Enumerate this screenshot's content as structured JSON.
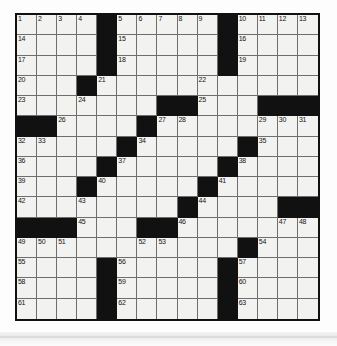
{
  "puzzle": {
    "type": "crossword-grid",
    "size": {
      "rows": 15,
      "cols": 15
    },
    "colors": {
      "page_background": "#fdfdfd",
      "cell_fill": "#f2f2f0",
      "block_fill": "#111111",
      "grid_line": "#6e6e6e",
      "outer_border": "#111111",
      "number_text": "#141414"
    },
    "legend": {
      "open_cell": "white-cell",
      "blocked_cell": "black-square"
    },
    "grid": [
      [
        "1",
        "2",
        "3",
        "4",
        "#",
        "5",
        "6",
        "7",
        "8",
        "9",
        "#",
        "10",
        "11",
        "12",
        "13"
      ],
      [
        "14",
        "",
        "",
        "",
        "#",
        "15",
        "",
        "",
        "",
        "",
        "#",
        "16",
        "",
        "",
        ""
      ],
      [
        "17",
        "",
        "",
        "",
        "#",
        "18",
        "",
        "",
        "",
        "",
        "#",
        "19",
        "",
        "",
        ""
      ],
      [
        "20",
        "",
        "",
        "#",
        "21",
        "",
        "",
        "",
        "",
        "22",
        "",
        "",
        "",
        "",
        ""
      ],
      [
        "23",
        "",
        "",
        "24",
        "",
        "",
        "",
        "#",
        "#",
        "25",
        "",
        "",
        "#",
        "#",
        "#"
      ],
      [
        "#",
        "#",
        "26",
        "",
        "",
        "",
        "#",
        "27",
        "28",
        "",
        "",
        "",
        "29",
        "30",
        "31"
      ],
      [
        "32",
        "33",
        "",
        "",
        "",
        "#",
        "34",
        "",
        "",
        "",
        "",
        "#",
        "35",
        "",
        ""
      ],
      [
        "36",
        "",
        "",
        "",
        "#",
        "37",
        "",
        "",
        "",
        "",
        "#",
        "38",
        "",
        "",
        ""
      ],
      [
        "39",
        "",
        "",
        "#",
        "40",
        "",
        "",
        "",
        "",
        "#",
        "41",
        "",
        "",
        "",
        ""
      ],
      [
        "42",
        "",
        "",
        "43",
        "",
        "",
        "",
        "",
        "#",
        "44",
        "",
        "",
        "",
        "#",
        "#"
      ],
      [
        "#",
        "#",
        "#",
        "45",
        "",
        "",
        "#",
        "#",
        "46",
        "",
        "",
        "",
        "",
        "47",
        "48"
      ],
      [
        "49",
        "50",
        "51",
        "",
        "",
        "",
        "52",
        "53",
        "",
        "",
        "",
        "#",
        "54",
        "",
        ""
      ],
      [
        "55",
        "",
        "",
        "",
        "#",
        "56",
        "",
        "",
        "",
        "",
        "#",
        "57",
        "",
        "",
        ""
      ],
      [
        "58",
        "",
        "",
        "",
        "#",
        "59",
        "",
        "",
        "",
        "",
        "#",
        "60",
        "",
        "",
        ""
      ],
      [
        "61",
        "",
        "",
        "",
        "#",
        "62",
        "",
        "",
        "",
        "",
        "#",
        "63",
        "",
        "",
        ""
      ]
    ],
    "numbers_present": [
      "1",
      "2",
      "3",
      "4",
      "5",
      "6",
      "7",
      "8",
      "9",
      "10",
      "11",
      "12",
      "13",
      "14",
      "15",
      "16",
      "17",
      "18",
      "19",
      "20",
      "21",
      "22",
      "23",
      "24",
      "25",
      "26",
      "27",
      "28",
      "29",
      "30",
      "31",
      "32",
      "33",
      "34",
      "35",
      "36",
      "37",
      "38",
      "39",
      "40",
      "41",
      "42",
      "43",
      "44",
      "45",
      "46",
      "47",
      "48",
      "49",
      "50",
      "51",
      "52",
      "53",
      "54",
      "55",
      "56",
      "57",
      "58",
      "59",
      "60",
      "61",
      "62",
      "63"
    ],
    "counts": {
      "total_cells": "225",
      "numbered_cells": "63"
    }
  }
}
